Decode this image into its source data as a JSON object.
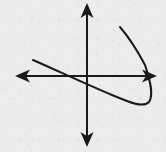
{
  "figure": {
    "kind": "math-graph",
    "width": 166,
    "height": 152,
    "background_color": "#f5f5f5",
    "ink_color": "#1a1a1a",
    "stroke_width": 2
  },
  "chart_data": {
    "type": "line",
    "title": "",
    "subtitle": "",
    "xlabel": "",
    "ylabel": "",
    "tick_labels": {
      "x": [],
      "y": []
    },
    "grid": false,
    "legend": null,
    "legend_position": "none",
    "annotations": [],
    "axes": {
      "origin": {
        "x": 87,
        "y": 76
      },
      "x_axis": {
        "name": "x-axis",
        "from": {
          "x": 15,
          "y": 76
        },
        "to": {
          "x": 157,
          "y": 76
        },
        "arrow_start": true,
        "arrow_end": true
      },
      "y_axis": {
        "name": "y-axis",
        "from": {
          "x": 87,
          "y": 147
        },
        "to": {
          "x": 87,
          "y": 3
        },
        "arrow_start": true,
        "arrow_end": true
      },
      "xlim": [
        15,
        157
      ],
      "ylim": [
        147,
        3
      ]
    },
    "series": [
      {
        "name": "parabola",
        "shape": "rightward-opening tilted parabola",
        "vertex": {
          "x": 149,
          "y": 100
        },
        "upper_endpoint": {
          "x": 120,
          "y": 27
        },
        "lower_endpoint": {
          "x": 33,
          "y": 60
        },
        "x_axis_crossings": [
          72,
          146
        ],
        "y_axis_crossings": [
          83
        ],
        "path": "M 33,60 C 58,71 88,85 112,95 C 131,103 143,108 149,102 C 154,95 150,80 145,65 C 136,48 126,34 120,27",
        "points": [
          {
            "x": 33,
            "y": 60
          },
          {
            "x": 45,
            "y": 65
          },
          {
            "x": 58,
            "y": 71
          },
          {
            "x": 72,
            "y": 77
          },
          {
            "x": 87,
            "y": 84
          },
          {
            "x": 100,
            "y": 90
          },
          {
            "x": 112,
            "y": 95
          },
          {
            "x": 124,
            "y": 100
          },
          {
            "x": 135,
            "y": 104
          },
          {
            "x": 144,
            "y": 105
          },
          {
            "x": 149,
            "y": 101
          },
          {
            "x": 150,
            "y": 92
          },
          {
            "x": 148,
            "y": 80
          },
          {
            "x": 146,
            "y": 70
          },
          {
            "x": 141,
            "y": 57
          },
          {
            "x": 134,
            "y": 45
          },
          {
            "x": 127,
            "y": 35
          },
          {
            "x": 120,
            "y": 27
          }
        ]
      }
    ]
  },
  "arrows": {
    "left": {
      "name": "x-axis-left-arrow",
      "tip": {
        "x": 15,
        "y": 76
      }
    },
    "right": {
      "name": "x-axis-right-arrow",
      "tip": {
        "x": 157,
        "y": 76
      }
    },
    "up": {
      "name": "y-axis-up-arrow",
      "tip": {
        "x": 87,
        "y": 3
      }
    },
    "down": {
      "name": "y-axis-down-arrow",
      "tip": {
        "x": 87,
        "y": 147
      }
    }
  }
}
